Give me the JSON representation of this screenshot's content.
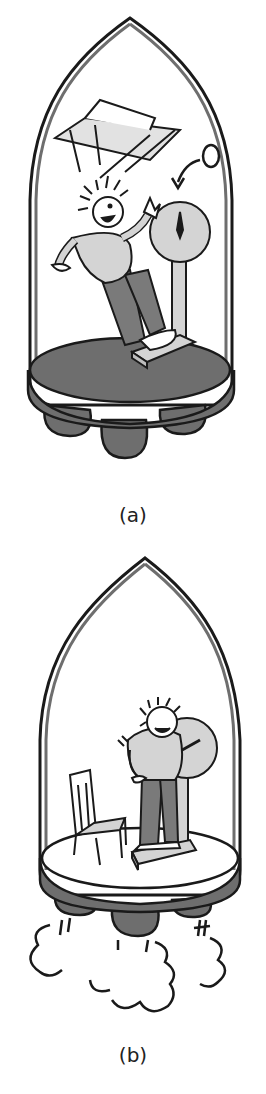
{
  "figure": {
    "panels": [
      {
        "id": "a",
        "caption": "(a)",
        "scale_reading": "0",
        "description": "Rocket in free fall: person and chair float weightlessly, scale reads zero"
      },
      {
        "id": "b",
        "caption": "(b)",
        "description": "Rocket accelerating with thrust: person stands on scale, chair rests on floor, exhaust clouds below"
      }
    ],
    "colors": {
      "outline": "#1a1a1a",
      "hull": "#6e6e6e",
      "floor_a": "#6e6e6e",
      "floor_b": "#ffffff",
      "light_fill": "#d4d4d4",
      "pants": "#7a7a7a",
      "background": "#ffffff"
    }
  }
}
